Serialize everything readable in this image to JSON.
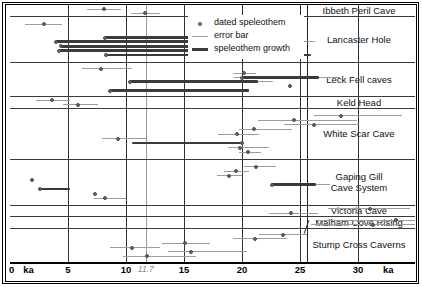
{
  "figure": {
    "units": "ka"
  },
  "legend": {
    "items": [
      {
        "key": "dated-speleothem",
        "label": "dated speleothem",
        "marker": "dot",
        "color": "#6b6b6b"
      },
      {
        "key": "error-bar",
        "label": "error bar",
        "marker": "line",
        "color": "#a5a5a5"
      },
      {
        "key": "speleothem-growth",
        "label": "speleothem growth",
        "marker": "thick-line",
        "color": "#3a3a3a"
      }
    ]
  },
  "chart_data": {
    "type": "bar",
    "xlabel": "ka",
    "ylabel": "",
    "xlim": [
      0,
      34.9
    ],
    "grid": true,
    "legend_position": "top-center",
    "axis": {
      "ticks": [
        {
          "value": 0,
          "label": "0"
        },
        {
          "value": 1.6,
          "label": "ka"
        },
        {
          "value": 5,
          "label": "5"
        },
        {
          "value": 10,
          "label": "10"
        },
        {
          "value": 11.7,
          "label": "11.7",
          "style": "highlight"
        },
        {
          "value": 15,
          "label": "15"
        },
        {
          "value": 20,
          "label": "20"
        },
        {
          "value": 25,
          "label": "25"
        },
        {
          "value": 30,
          "label": "30"
        },
        {
          "value": 32.6,
          "label": "ka"
        }
      ],
      "gridlines": [
        0,
        5,
        10,
        15,
        20,
        25,
        30
      ],
      "highlight_line": 11.7
    },
    "groups": [
      {
        "name": "Ibbeth Peril Cave",
        "rows": [
          {
            "point": 8.1,
            "err": [
              6.6,
              9.6
            ]
          },
          {
            "point": 11.6,
            "err": [
              10.4,
              12.9
            ]
          }
        ]
      },
      {
        "name": "Lancaster Hole",
        "rows": [
          {
            "point": 2.9,
            "err": [
              1.3,
              4.5
            ]
          },
          {
            "growth": [
              16.1,
              21.2
            ],
            "point": 16.1,
            "err": [
              16.1,
              22.2
            ]
          },
          {
            "point": 19.3,
            "err": [
              18.2,
              20.4
            ]
          },
          {
            "growth": [
              8.2,
              21.2
            ],
            "point": 8.2
          },
          {
            "growth": [
              4.0,
              22.9
            ],
            "point": 4.0,
            "err": [
              22.9,
              26.3
            ]
          },
          {
            "growth": [
              4.4,
              24.3
            ],
            "point": 4.4
          },
          {
            "growth": [
              4.2,
              21.0
            ],
            "point": 4.2
          },
          {
            "growth": [
              8.3,
              25.9
            ],
            "point": 8.3
          }
        ]
      },
      {
        "name": "Leck Fell caves",
        "rows": [
          {
            "point": 7.8,
            "err": [
              6.2,
              10.5
            ]
          },
          {
            "point": 20.2,
            "err": [
              19.2,
              21.2
            ]
          },
          {
            "growth": [
              20.0,
              26.6
            ],
            "point": 20.0,
            "err": [
              19.3,
              28.4
            ]
          },
          {
            "growth": [
              10.3,
              21.4
            ],
            "point": 10.3,
            "err": [
              10.3,
              22.7
            ]
          },
          {
            "point": 24.1
          },
          {
            "growth": [
              8.6,
              20.6
            ],
            "point": 8.6
          }
        ]
      },
      {
        "name": "Keld Head",
        "rows": [
          {
            "point": 3.6,
            "err": [
              2.2,
              5.2
            ]
          },
          {
            "point": 5.9,
            "err": [
              4.6,
              7.6
            ]
          }
        ]
      },
      {
        "name": "White Scar Cave",
        "rows": [
          {
            "point": 28.5,
            "err": [
              26.2,
              33.8
            ]
          },
          {
            "point": 24.5,
            "err": [
              21.4,
              29.9
            ]
          },
          {
            "point": 26.2,
            "err": [
              23.6,
              30.1
            ]
          },
          {
            "point": 21.0,
            "err": [
              19.7,
              24.3
            ]
          },
          {
            "point": 19.6,
            "err": [
              17.9,
              21.5
            ]
          },
          {
            "point": 9.3,
            "err": [
              7.9,
              11.7
            ]
          },
          {
            "growth": [
              10.5,
              20.0
            ],
            "point": 20.0
          },
          {
            "point": 19.8,
            "err": [
              18.8,
              22.3
            ]
          },
          {
            "point": 20.5,
            "err": [
              19.7,
              21.6
            ]
          }
        ]
      },
      {
        "name": "Gaping Gill Cave System",
        "rows": [
          {
            "point": 21.2,
            "err": [
              20.2,
              22.9
            ]
          },
          {
            "point": 19.5,
            "err": [
              18.4,
              20.6
            ]
          },
          {
            "point": 18.9,
            "err": [
              17.8,
              20.0
            ]
          },
          {
            "point": 1.9
          },
          {
            "growth": [
              22.6,
              26.4
            ],
            "point": 22.6,
            "err": [
              22.6,
              27.6
            ]
          },
          {
            "growth": [
              2.6,
              5.2
            ],
            "point": 2.6
          },
          {
            "point": 7.3
          },
          {
            "point": 8.2,
            "err": [
              7.2,
              10.0
            ]
          }
        ]
      },
      {
        "name": "Victoria Cave",
        "rows": [
          {
            "point": 31.0,
            "err": [
              27.4,
              34.5
            ]
          },
          {
            "point": 24.2,
            "err": [
              22.3,
              26.5
            ]
          }
        ]
      },
      {
        "name": "Malham Cove Rising",
        "rows": [
          {
            "point": 33.3,
            "err": [
              26.5,
              34.9
            ]
          },
          {
            "point": 31.3,
            "err": [
              25.9,
              34.9
            ]
          }
        ],
        "leader_arrow": true
      },
      {
        "name": "Stump Cross Caverns",
        "rows": [
          {
            "point": 23.5,
            "err": [
              21.5,
              25.6
            ]
          },
          {
            "point": 21.1,
            "err": [
              19.2,
              23.9
            ]
          },
          {
            "point": 15.1,
            "err": [
              13.1,
              17.2
            ]
          },
          {
            "point": 10.5,
            "err": [
              8.6,
              12.9
            ]
          },
          {
            "point": 15.6,
            "err": [
              13.6,
              20.4
            ]
          },
          {
            "point": 11.8,
            "err": [
              9.7,
              16.0
            ]
          }
        ]
      }
    ]
  }
}
